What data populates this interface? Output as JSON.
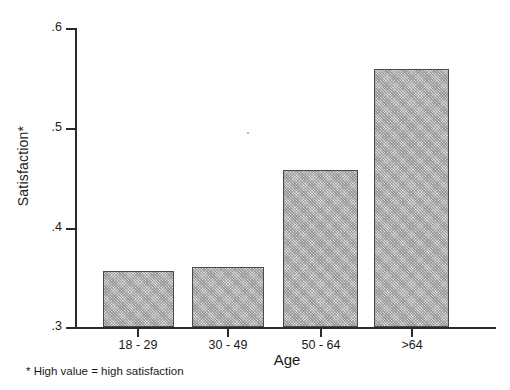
{
  "chart_data": {
    "type": "bar",
    "title": "",
    "subtitle": "",
    "xlabel": "Age",
    "ylabel": "Satisfaction*",
    "categories": [
      "18 - 29",
      "30 - 49",
      "50 - 64",
      ">64"
    ],
    "values": [
      0.356,
      0.36,
      0.458,
      0.559
    ],
    "ylim": [
      0.3,
      0.6
    ],
    "yticks": [
      0.3,
      0.4,
      0.5,
      0.6
    ],
    "ytick_labels": [
      ".3",
      ".4",
      ".5",
      ".6"
    ],
    "grid": false,
    "legend": null,
    "annotations": [
      "* High value = high satisfaction"
    ],
    "bar_fill": "#d8d8d8",
    "bar_edge": "#4a4a4a",
    "axis_color": "#2b2b2b"
  },
  "axes": {
    "y_title": "Satisfaction*",
    "x_title": "Age",
    "y_tick_labels": [
      ".6",
      ".5",
      ".4",
      ".3"
    ],
    "x_tick_labels": [
      "18 - 29",
      "30 - 49",
      "50 - 64",
      ">64"
    ]
  },
  "footnote": {
    "text": "* High value = high satisfaction"
  }
}
